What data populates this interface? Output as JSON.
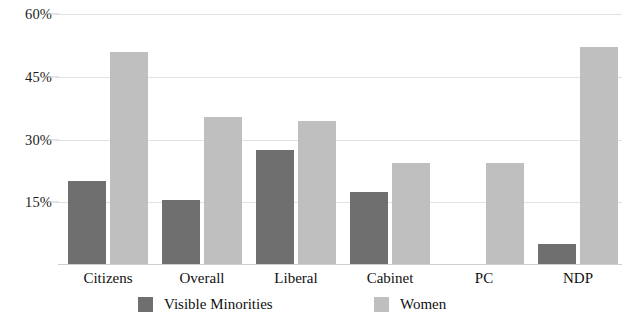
{
  "chart_data": {
    "type": "bar",
    "title": "",
    "subtitle": "",
    "xlabel": "",
    "ylabel": "",
    "categories": [
      "Citizens",
      "Overall",
      "Liberal",
      "Cabinet",
      "PC",
      "NDP"
    ],
    "series": [
      {
        "name": "Visible Minorities",
        "color": "#6f6f6f",
        "values": [
          20.0,
          15.5,
          27.5,
          17.5,
          null,
          5.0
        ]
      },
      {
        "name": "Women",
        "color": "#bfbfbf",
        "values": [
          51.0,
          35.5,
          34.5,
          24.5,
          24.5,
          52.0
        ]
      }
    ],
    "ylim": [
      0,
      60
    ],
    "yticks": [
      15,
      30,
      45,
      60
    ],
    "ytick_labels": [
      "15%",
      "30%",
      "45%",
      "60%"
    ],
    "grid": true,
    "legend_position": "bottom"
  },
  "legend": {
    "items": [
      {
        "label": "Visible Minorities",
        "color": "#6f6f6f"
      },
      {
        "label": "Women",
        "color": "#bfbfbf"
      }
    ]
  },
  "colors": {
    "visible_minorities": "#6f6f6f",
    "women": "#bfbfbf",
    "gridline": "#e2e2e2",
    "text": "#111111",
    "background": "#ffffff"
  }
}
